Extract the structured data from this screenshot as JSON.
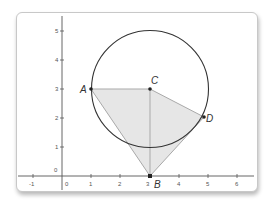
{
  "diagram": {
    "type": "coordinate-geometry",
    "axes": {
      "x_ticks": [
        "-1",
        "0",
        "1",
        "2",
        "3",
        "4",
        "5",
        "6"
      ],
      "y_ticks": [
        "0",
        "1",
        "2",
        "3",
        "4",
        "5"
      ],
      "x_range": [
        -1.5,
        6.5
      ],
      "y_range": [
        -0.5,
        5.5
      ]
    },
    "points": [
      {
        "label": "A",
        "x": 1,
        "y": 3
      },
      {
        "label": "C",
        "x": 3,
        "y": 3
      },
      {
        "label": "D",
        "x": 4.8,
        "y": 1.8
      },
      {
        "label": "B",
        "x": 3,
        "y": 0
      }
    ],
    "circle": {
      "center": "C",
      "radius": 2
    },
    "polygon": [
      "A",
      "C",
      "D",
      "B"
    ],
    "segments": [
      [
        "C",
        "B"
      ]
    ],
    "colors": {
      "fill": "#e6e6e6",
      "polygon_stroke": "#a9a9a9",
      "circle_stroke": "#333333",
      "axis": "#555555",
      "point": "#222222"
    }
  }
}
